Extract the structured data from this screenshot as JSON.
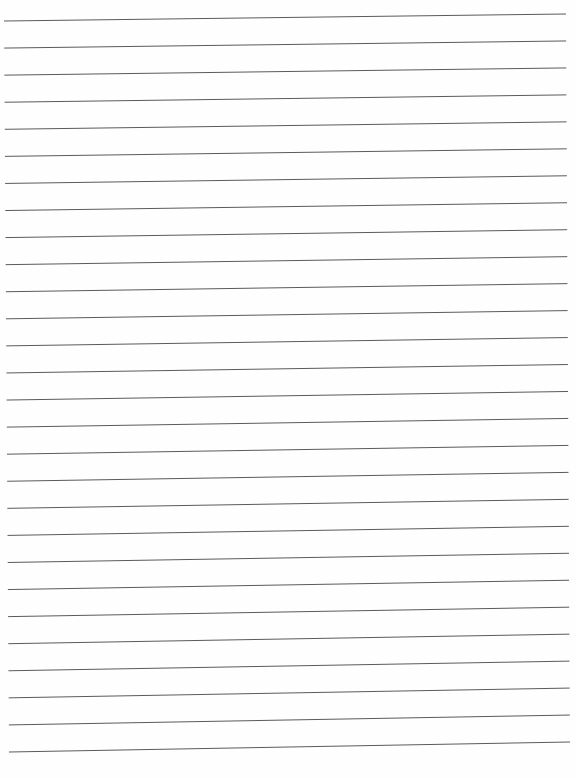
{
  "page": {
    "type": "lined-paper",
    "line_count": 28,
    "line_color": "#5a5a5a",
    "background": "#fefefe",
    "first_line": {
      "x1": 4,
      "y1": 21,
      "x2": 566,
      "y2": 14
    },
    "last_line": {
      "x1": 9,
      "y1": 752,
      "x2": 570,
      "y2": 742
    },
    "text": ""
  }
}
